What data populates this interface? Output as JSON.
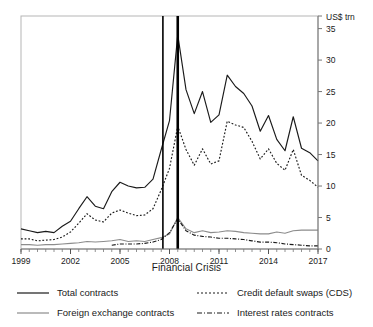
{
  "chart_data": {
    "type": "line",
    "title": "",
    "xlabel": "Financial Crisis",
    "ylabel": "",
    "y_unit_label": "US$ trn",
    "xlim": [
      1999,
      2017
    ],
    "ylim": [
      0,
      37
    ],
    "yticks": [
      0,
      5,
      10,
      15,
      20,
      25,
      30,
      35
    ],
    "ytick_labels": [
      "0",
      "5",
      "10",
      "15",
      "20",
      "25",
      "30",
      "35"
    ],
    "xticks": [
      1999,
      2002,
      2005,
      2008,
      2011,
      2014,
      2017
    ],
    "xtick_labels": [
      "1999",
      "2002",
      "2005",
      "2008",
      "2011",
      "2014",
      "2017"
    ],
    "x_minor_tick_interval": 0.5,
    "grid": false,
    "legend_position": "below",
    "annotations": [
      {
        "type": "vline",
        "name": "crisis-start-line",
        "x": 2007.6,
        "label": "Financial Crisis"
      },
      {
        "type": "vline",
        "name": "crisis-peak-line",
        "x": 2008.5,
        "label": "Financial Crisis"
      }
    ],
    "x": [
      1999,
      1999.5,
      2000,
      2000.5,
      2001,
      2001.5,
      2002,
      2002.5,
      2003,
      2003.5,
      2004,
      2004.5,
      2005,
      2005.5,
      2006,
      2006.5,
      2007,
      2007.5,
      2008,
      2008.5,
      2009,
      2009.5,
      2010,
      2010.5,
      2011,
      2011.5,
      2012,
      2012.5,
      2013,
      2013.5,
      2014,
      2014.5,
      2015,
      2015.5,
      2016,
      2016.5,
      2017
    ],
    "series": [
      {
        "name": "Total contracts",
        "style": "solid",
        "color": "#1a1a1a",
        "values": [
          3.2,
          2.9,
          2.6,
          2.8,
          2.6,
          3.6,
          4.4,
          6.4,
          8.3,
          6.8,
          6.4,
          9.1,
          10.6,
          10.0,
          9.7,
          9.8,
          11.1,
          15.8,
          20.4,
          34.0,
          25.3,
          21.5,
          25.0,
          20.1,
          21.3,
          27.6,
          25.8,
          24.7,
          22.7,
          18.7,
          21.2,
          17.4,
          15.6,
          21.0,
          16.0,
          15.3,
          14.0
        ]
      },
      {
        "name": "Credit default swaps (CDS)",
        "style": "dotted",
        "color": "#1a1a1a",
        "values": [
          1.6,
          1.6,
          1.3,
          1.4,
          1.5,
          1.9,
          2.7,
          4.1,
          5.6,
          4.6,
          4.3,
          5.7,
          6.2,
          5.7,
          5.3,
          5.4,
          6.4,
          9.4,
          12.8,
          19.5,
          15.8,
          13.3,
          15.9,
          13.5,
          14.0,
          20.3,
          19.7,
          19.3,
          17.1,
          14.3,
          15.9,
          13.6,
          12.5,
          15.8,
          11.7,
          10.9,
          9.8
        ]
      },
      {
        "name": "Foreign exchange contracts",
        "style": "solid",
        "color": "#8c8c8c",
        "values": [
          0.7,
          0.7,
          0.6,
          0.7,
          0.7,
          0.8,
          0.9,
          1.0,
          1.2,
          1.1,
          1.2,
          1.3,
          1.5,
          1.2,
          1.3,
          1.2,
          1.5,
          1.8,
          2.4,
          5.0,
          3.2,
          2.6,
          2.9,
          2.6,
          2.7,
          2.9,
          2.8,
          2.6,
          2.5,
          2.4,
          2.4,
          2.7,
          2.5,
          2.9,
          3.0,
          3.0,
          3.0
        ]
      },
      {
        "name": "Interest rates contracts",
        "style": "dashdot",
        "color": "#1a1a1a",
        "values": [
          null,
          null,
          null,
          null,
          null,
          null,
          null,
          null,
          null,
          null,
          null,
          0.6,
          0.8,
          0.8,
          0.8,
          0.9,
          1.1,
          1.5,
          2.6,
          4.8,
          2.9,
          2.2,
          2.0,
          1.9,
          1.7,
          1.7,
          1.6,
          1.5,
          1.3,
          1.1,
          1.1,
          1.0,
          0.8,
          0.7,
          0.6,
          0.5,
          0.5
        ]
      }
    ]
  },
  "legend": {
    "items": [
      {
        "label": "Total contracts",
        "style": "solid",
        "color": "#1a1a1a"
      },
      {
        "label": "Credit default swaps (CDS)",
        "style": "dotted",
        "color": "#1a1a1a"
      },
      {
        "label": "Foreign exchange contracts",
        "style": "solid",
        "color": "#8c8c8c"
      },
      {
        "label": "Interest rates contracts",
        "style": "dashdot",
        "color": "#1a1a1a"
      }
    ]
  },
  "axis": {
    "unit_label": "US$ trn",
    "x_title": "Financial Crisis"
  }
}
